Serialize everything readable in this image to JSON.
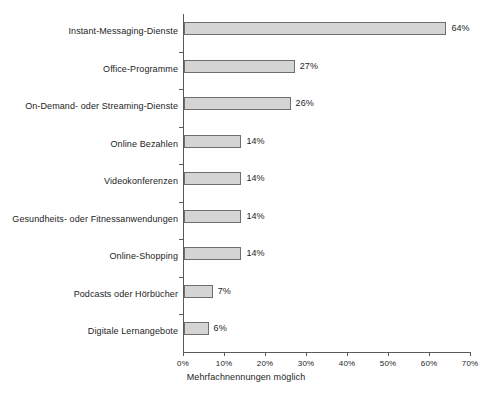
{
  "chart_data": {
    "type": "bar",
    "orientation": "horizontal",
    "title": "",
    "xlabel": "Mehrfachnennungen möglich",
    "ylabel": "",
    "xlim": [
      0,
      70
    ],
    "xtick_step": 10,
    "grid": false,
    "legend": null,
    "value_suffix": "%",
    "categories": [
      "Instant-Messaging-Dienste",
      "Office-Programme",
      "On-Demand- oder Streaming-Dienste",
      "Online Bezahlen",
      "Videokonferenzen",
      "Gesundheits- oder Fitnessanwendungen",
      "Online-Shopping",
      "Podcasts oder Hörbücher",
      "Digitale Lernangebote"
    ],
    "values": [
      64,
      27,
      26,
      14,
      14,
      14,
      14,
      7,
      6
    ],
    "value_labels": [
      "64%",
      "27%",
      "26%",
      "14%",
      "14%",
      "14%",
      "14%",
      "7%",
      "6%"
    ],
    "xtick_labels": [
      "0%",
      "10%",
      "20%",
      "30%",
      "40%",
      "50%",
      "60%",
      "70%"
    ],
    "xtick_values": [
      0,
      10,
      20,
      30,
      40,
      50,
      60,
      70
    ],
    "colors": {
      "bar_fill": "#d4d4d4",
      "bar_border": "#6e6e6e",
      "axis": "#5a5a5a",
      "text": "#1d1d1d",
      "background": "#ffffff"
    }
  },
  "caption": {
    "text": "Mehrfachnennungen möglich"
  }
}
